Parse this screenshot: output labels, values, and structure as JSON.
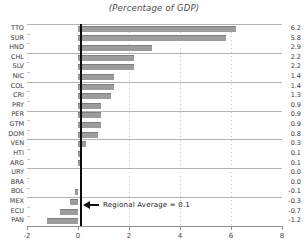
{
  "title": "(Percentage of GDP)",
  "chart_data": {
    "type": "bar",
    "orientation": "horizontal",
    "title": "(Percentage of GDP)",
    "xlabel": "",
    "ylabel": "",
    "categories": [
      "TTO",
      "SUR",
      "HND",
      "CHL",
      "SLV",
      "NIC",
      "COL",
      "CRI",
      "PRY",
      "PER",
      "GTM",
      "DOM",
      "VEN",
      "HTI",
      "ARG",
      "URY",
      "BRA",
      "BOL",
      "MEX",
      "ECU",
      "PAN"
    ],
    "values": [
      6.2,
      5.8,
      2.9,
      2.2,
      2.2,
      1.4,
      1.4,
      1.3,
      0.9,
      0.9,
      0.9,
      0.8,
      0.3,
      0.1,
      0.1,
      0.0,
      0.0,
      -0.1,
      -0.3,
      -0.7,
      -1.2
    ],
    "value_labels": [
      "6.2",
      "5.8",
      "2.9",
      "2.2",
      "2.2",
      "1.4",
      "1.4",
      "1.3",
      "0.9",
      "0.9",
      "0.9",
      "0.8",
      "0.3",
      "0.1",
      "0.1",
      "0.0",
      "0.0",
      "-0.1",
      "-0.3",
      "-0.7",
      "-1.2"
    ],
    "xlim": [
      -2,
      8
    ],
    "x_ticks": [
      "-2",
      "0",
      "2",
      "4",
      "6",
      "8"
    ],
    "x_tick_values": [
      -2,
      0,
      2,
      4,
      6,
      8
    ],
    "dotted_gridlines_at": [
      2,
      4,
      6
    ],
    "group_separator_every": 3,
    "grid": "horizontal group separators, dotted verticals",
    "legend": null,
    "annotation": {
      "text": "Regional Average = 0.1",
      "value": 0.1
    },
    "colors": {
      "bar": "#9c9c9c",
      "bar_edge": "#7e7e7e",
      "average_line": "#0d0d0d",
      "separator": "#b3b3b3",
      "axis": "#8e8e8e",
      "text": "#3a3a3a"
    }
  }
}
